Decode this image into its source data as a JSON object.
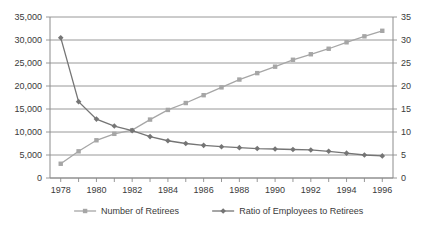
{
  "chart_data": {
    "type": "line",
    "title": "",
    "subtitle": "",
    "xlabel": "",
    "ylabel": "",
    "grid": true,
    "legend_position": "bottom",
    "x": [
      1978,
      1979,
      1980,
      1981,
      1982,
      1983,
      1984,
      1985,
      1986,
      1987,
      1988,
      1989,
      1990,
      1991,
      1992,
      1993,
      1994,
      1995,
      1996
    ],
    "x_tick_labels": [
      "1978",
      "1980",
      "1982",
      "1984",
      "1986",
      "1988",
      "1990",
      "1992",
      "1994",
      "1996"
    ],
    "x_tick_values": [
      1978,
      1980,
      1982,
      1984,
      1986,
      1988,
      1990,
      1992,
      1994,
      1996
    ],
    "xlim": [
      1977.4,
      1996.6
    ],
    "axes": [
      {
        "id": "left",
        "side": "left",
        "ylim": [
          0,
          35000
        ],
        "ticks": [
          0,
          5000,
          10000,
          15000,
          20000,
          25000,
          30000,
          35000
        ],
        "tick_labels": [
          "0",
          "5,000",
          "10,000",
          "15,000",
          "20,000",
          "25,000",
          "30,000",
          "35,000"
        ]
      },
      {
        "id": "right",
        "side": "right",
        "ylim": [
          0,
          35
        ],
        "ticks": [
          0,
          5,
          10,
          15,
          20,
          25,
          30,
          35
        ],
        "tick_labels": [
          "0",
          "5",
          "10",
          "15",
          "20",
          "25",
          "30",
          "35"
        ]
      }
    ],
    "series": [
      {
        "name": "Number of Retirees",
        "axis": "left",
        "marker": "square",
        "color": "#a6a6a6",
        "values": [
          3100,
          5800,
          8200,
          9600,
          10400,
          12700,
          14800,
          16300,
          18000,
          19700,
          21400,
          22800,
          24200,
          25700,
          26900,
          28100,
          29500,
          30800,
          32000
        ]
      },
      {
        "name": "Ratio of Employees to Retirees",
        "axis": "right",
        "marker": "diamond",
        "color": "#757575",
        "values": [
          30.5,
          16.6,
          12.8,
          11.3,
          10.3,
          9.0,
          8.1,
          7.5,
          7.1,
          6.8,
          6.6,
          6.4,
          6.3,
          6.2,
          6.1,
          5.8,
          5.4,
          5.0,
          4.8
        ]
      }
    ],
    "legend": [
      {
        "label": "Number of Retirees",
        "marker": "square",
        "color": "#a6a6a6"
      },
      {
        "label": "Ratio of Employees to Retirees",
        "marker": "diamond",
        "color": "#757575"
      }
    ],
    "colors": {
      "retirees": "#a6a6a6",
      "ratio": "#757575",
      "grid": "#8c8c8c",
      "axis": "#8c8c8c",
      "text": "#3a3a3a",
      "background": "#ffffff"
    }
  }
}
